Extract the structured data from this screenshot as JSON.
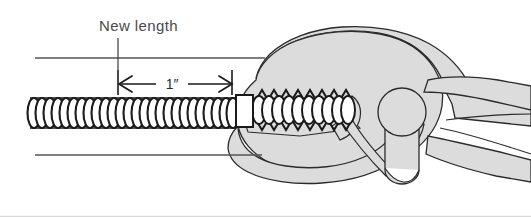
{
  "figure": {
    "title_label": "New length",
    "dimension_label": "1″",
    "background_color": "#ffffff",
    "tool_fill_color": "#dcdcdc",
    "outline_color": "#2b2b2b",
    "guide_line_color": "#555555",
    "label_color": "#4a4a4a",
    "border_color": "#d9d9d9",
    "annotations": {
      "leader_line": "leader-line",
      "top_guide": "top-guide-line",
      "bottom_guide": "bottom-guide-line",
      "dimension_line": "dimension-line",
      "left_arrow": "left-arrowhead",
      "right_arrow": "right-arrowhead",
      "left_extension_tick": "left-extension-tick",
      "right_extension_tick": "right-extension-tick"
    },
    "objects": {
      "compressed_spring": "compressed-coil-spring",
      "spacer_block": "white-spacer-block",
      "stretched_spring": "stretched-coil-spring",
      "pliers": "locking-pliers",
      "upper_jaw": "pliers-upper-jaw",
      "lower_jaw": "pliers-lower-jaw",
      "pivot": "pliers-pivot-circle",
      "pivot_post": "pliers-pivot-post",
      "handle_upper": "pliers-upper-handle",
      "handle_lower": "pliers-lower-handle"
    }
  }
}
